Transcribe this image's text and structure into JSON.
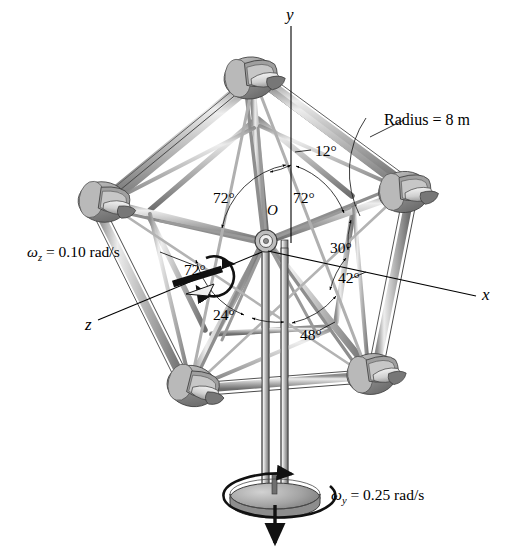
{
  "figure": {
    "background_color": "#ffffff",
    "line_color": "#000000",
    "metal_light": "#d9d9d9",
    "metal_mid": "#a8a8a8",
    "metal_dark": "#6e6e6e"
  },
  "axes": {
    "y_label": "y",
    "x_label": "x",
    "z_label": "z",
    "origin_label": "O"
  },
  "annotations": {
    "radius": "Radius = 8 m",
    "omega_z": {
      "symbol": "ω",
      "subscript": "z",
      "text": " = 0.10 rad/s",
      "full": "ωz = 0.10 rad/s",
      "value": 0.1,
      "units": "rad/s"
    },
    "omega_y": {
      "symbol": "ω",
      "subscript": "y",
      "text": " = 0.25 rad/s",
      "full": "ωy = 0.25 rad/s",
      "value": 0.25,
      "units": "rad/s"
    }
  },
  "angles": [
    {
      "id": "a12",
      "label": "12°",
      "value": 12
    },
    {
      "id": "a72a",
      "label": "72°",
      "value": 72
    },
    {
      "id": "a72b",
      "label": "72°",
      "value": 72
    },
    {
      "id": "a72c",
      "label": "72°",
      "value": 72
    },
    {
      "id": "a30",
      "label": "30°",
      "value": 30
    },
    {
      "id": "a42",
      "label": "42°",
      "value": 42
    },
    {
      "id": "a24",
      "label": "24°",
      "value": 24
    },
    {
      "id": "a48",
      "label": "48°",
      "value": 48
    }
  ],
  "structure": {
    "vertex_count": 5,
    "vertex_names": [
      "top",
      "left",
      "right",
      "bottom-left",
      "bottom-right"
    ]
  }
}
